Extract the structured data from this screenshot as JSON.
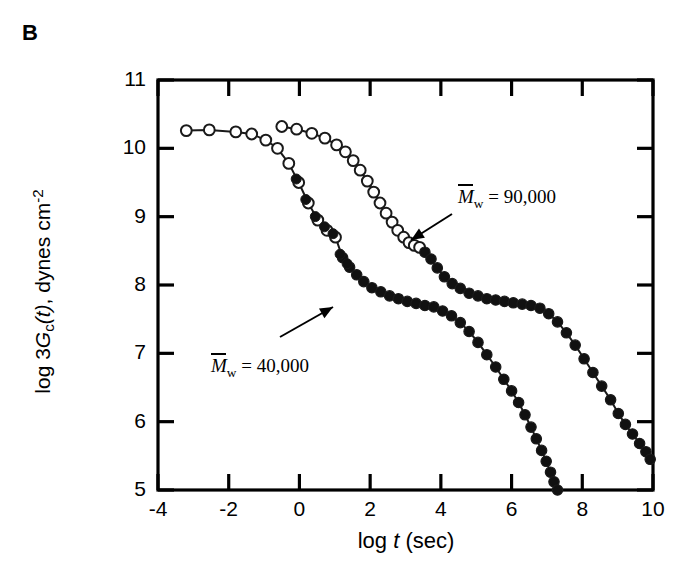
{
  "panel": {
    "label": "B"
  },
  "axes": {
    "ylabel_prefix": "log 3",
    "ylabel_g": "G",
    "ylabel_gsub": "c",
    "ylabel_t": "(t)",
    "ylabel_rest": ", dynes cm",
    "ylabel_sup": "-2",
    "ylabel_plain": "log 3Gc(t), dynes cm-2",
    "xlabel_prefix": "log ",
    "xlabel_t": "t",
    "xlabel_rest": " (sec)",
    "xlabel_plain": "log t (sec)",
    "ytick_labels": [
      "11",
      "10",
      "9",
      "8",
      "7",
      "6",
      "5"
    ],
    "xtick_labels": [
      "-4",
      "-2",
      "0",
      "2",
      "4",
      "6",
      "8",
      "10"
    ]
  },
  "annotations": {
    "series_hi": {
      "m_symbol": "M",
      "m_sub": "w",
      "equals": " = 90,000",
      "full": "Mw = 90,000"
    },
    "series_lo": {
      "m_symbol": "M",
      "m_sub": "w",
      "equals": " = 40,000",
      "full": "Mw = 40,000"
    }
  },
  "colors": {
    "axis": "#000000",
    "curve": "#1a1a1a",
    "open_marker_fill": "#ffffff",
    "filled_marker_fill": "#111111"
  },
  "chart_data": {
    "type": "line",
    "title": "",
    "xlabel": "log t (sec)",
    "ylabel": "log 3Gc(t), dynes cm-2",
    "xlim": [
      -4,
      10
    ],
    "ylim": [
      5,
      11
    ],
    "grid": false,
    "legend": "annotated-arrows",
    "xticks": [
      -4,
      -2,
      0,
      2,
      4,
      6,
      8,
      10
    ],
    "yticks": [
      5,
      6,
      7,
      8,
      9,
      10,
      11
    ],
    "series": [
      {
        "name": "Mw = 40,000",
        "marker": "mixed-open-then-filled",
        "open_points_count": 12,
        "x": [
          -3.2,
          -2.55,
          -1.8,
          -1.35,
          -0.95,
          -0.62,
          -0.3,
          -0.02,
          0.25,
          0.52,
          0.78,
          1.02,
          1.22,
          1.42,
          1.62,
          1.82,
          2.05,
          2.3,
          2.55,
          2.8,
          3.05,
          3.3,
          3.55,
          3.8,
          4.05,
          4.3,
          4.55,
          4.8,
          5.05,
          5.3,
          5.55,
          5.78,
          6.0,
          6.2,
          6.38,
          6.55,
          6.7,
          6.85,
          6.98,
          7.1,
          7.2,
          7.3
        ],
        "y": [
          10.26,
          10.27,
          10.24,
          10.21,
          10.12,
          10.0,
          9.78,
          9.5,
          9.2,
          8.95,
          8.8,
          8.7,
          8.4,
          8.26,
          8.15,
          8.05,
          7.96,
          7.9,
          7.84,
          7.8,
          7.76,
          7.73,
          7.7,
          7.68,
          7.62,
          7.55,
          7.45,
          7.32,
          7.16,
          6.98,
          6.8,
          6.62,
          6.45,
          6.28,
          6.1,
          5.92,
          5.75,
          5.58,
          5.42,
          5.26,
          5.12,
          5.0
        ]
      },
      {
        "name": "Mw = 90,000",
        "marker": "mixed-open-then-filled",
        "open_points_count": 18,
        "x": [
          -0.5,
          -0.08,
          0.35,
          0.72,
          1.05,
          1.3,
          1.52,
          1.72,
          1.92,
          2.1,
          2.28,
          2.45,
          2.62,
          2.78,
          2.95,
          3.1,
          3.25,
          3.4,
          3.55,
          3.72,
          3.9,
          4.1,
          4.32,
          4.55,
          4.8,
          5.05,
          5.3,
          5.55,
          5.8,
          6.05,
          6.3,
          6.55,
          6.8,
          7.05,
          7.3,
          7.55,
          7.8,
          8.05,
          8.3,
          8.55,
          8.8,
          9.02,
          9.22,
          9.42,
          9.62,
          9.8,
          9.92
        ],
        "y": [
          10.32,
          10.28,
          10.22,
          10.15,
          10.05,
          9.95,
          9.82,
          9.68,
          9.52,
          9.36,
          9.2,
          9.05,
          8.92,
          8.8,
          8.7,
          8.62,
          8.58,
          8.55,
          8.48,
          8.38,
          8.25,
          8.12,
          8.02,
          7.95,
          7.88,
          7.84,
          7.8,
          7.78,
          7.76,
          7.74,
          7.72,
          7.7,
          7.66,
          7.58,
          7.46,
          7.3,
          7.12,
          6.92,
          6.72,
          6.52,
          6.32,
          6.12,
          5.96,
          5.82,
          5.68,
          5.56,
          5.45
        ]
      }
    ]
  }
}
